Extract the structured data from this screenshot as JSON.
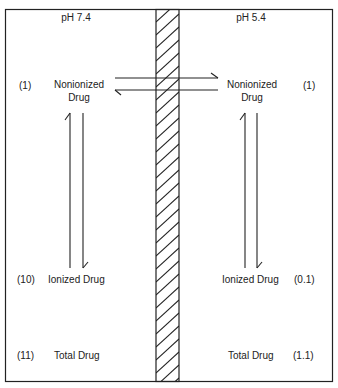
{
  "left": {
    "ph_label": "pH 7.4",
    "nonionized": {
      "value": "(1)",
      "label_line1": "Nonionized",
      "label_line2": "Drug"
    },
    "ionized": {
      "value": "(10)",
      "label": "Ionized Drug"
    },
    "total": {
      "value": "(11)",
      "label": "Total Drug"
    }
  },
  "right": {
    "ph_label": "pH 5.4",
    "nonionized": {
      "value": "(1)",
      "label_line1": "Nonionized",
      "label_line2": "Drug"
    },
    "ionized": {
      "value": "(0.1)",
      "label": "Ionized Drug"
    },
    "total": {
      "value": "(1.1)",
      "label": "Total Drug"
    }
  },
  "membrane": {
    "pattern": "diagonal-hatch"
  },
  "colors": {
    "line": "#222222",
    "background": "#ffffff"
  }
}
